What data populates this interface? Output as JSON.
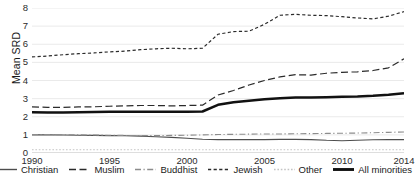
{
  "chart_data": {
    "type": "line",
    "title": "",
    "xlabel": "",
    "ylabel": "Mean SRD",
    "xlim": [
      1990,
      2014
    ],
    "ylim": [
      0,
      8
    ],
    "yticks": [
      0,
      1,
      2,
      3,
      4,
      5,
      6,
      7,
      8
    ],
    "xticks": [
      1990,
      1995,
      2000,
      2005,
      2010,
      2014
    ],
    "grid": "horizontal",
    "legend_position": "bottom",
    "x": [
      1990,
      1991,
      1992,
      1993,
      1994,
      1995,
      1996,
      1997,
      1998,
      1999,
      2000,
      2001,
      2002,
      2003,
      2004,
      2005,
      2006,
      2007,
      2008,
      2009,
      2010,
      2011,
      2012,
      2013,
      2014
    ],
    "series": [
      {
        "name": "Christian",
        "style": "solid-thin",
        "color": "#4d4d4d",
        "values": [
          1.0,
          1.0,
          0.99,
          0.98,
          0.97,
          0.96,
          0.95,
          0.93,
          0.9,
          0.86,
          0.81,
          0.76,
          0.74,
          0.74,
          0.74,
          0.74,
          0.75,
          0.75,
          0.74,
          0.7,
          0.68,
          0.7,
          0.73,
          0.74,
          0.74
        ]
      },
      {
        "name": "Muslim",
        "style": "long-dash",
        "color": "#2b2b2b",
        "values": [
          2.55,
          2.52,
          2.52,
          2.54,
          2.55,
          2.58,
          2.6,
          2.62,
          2.62,
          2.6,
          2.62,
          2.64,
          3.2,
          3.45,
          3.75,
          4.0,
          4.2,
          4.32,
          4.3,
          4.4,
          4.45,
          4.48,
          4.55,
          4.7,
          5.2
        ]
      },
      {
        "name": "Buddhist",
        "style": "dash-dot",
        "color": "#8c8c8c",
        "values": [
          1.02,
          1.02,
          1.01,
          1.0,
          0.99,
          0.98,
          0.97,
          0.96,
          0.96,
          0.97,
          0.98,
          1.0,
          1.02,
          1.03,
          1.04,
          1.05,
          1.05,
          1.06,
          1.07,
          1.08,
          1.09,
          1.1,
          1.12,
          1.14,
          1.16
        ]
      },
      {
        "name": "Jewish",
        "style": "short-dash",
        "color": "#2b2b2b",
        "values": [
          5.3,
          5.35,
          5.42,
          5.48,
          5.52,
          5.58,
          5.62,
          5.7,
          5.75,
          5.78,
          5.75,
          5.78,
          6.55,
          6.7,
          6.72,
          7.1,
          7.6,
          7.65,
          7.6,
          7.58,
          7.52,
          7.45,
          7.4,
          7.55,
          7.8
        ]
      },
      {
        "name": "Other",
        "style": "fine-dot",
        "color": "#c4c4c4",
        "values": [
          0.18,
          0.18,
          0.18,
          0.18,
          0.18,
          0.18,
          0.18,
          0.18,
          0.18,
          0.18,
          0.18,
          0.18,
          0.18,
          0.18,
          0.18,
          0.18,
          0.18,
          0.18,
          0.18,
          0.18,
          0.18,
          0.18,
          0.18,
          0.18,
          0.18
        ]
      },
      {
        "name": "All minorities",
        "style": "solid-bold",
        "color": "#111111",
        "values": [
          2.25,
          2.24,
          2.24,
          2.25,
          2.26,
          2.27,
          2.28,
          2.28,
          2.28,
          2.27,
          2.28,
          2.29,
          2.66,
          2.8,
          2.88,
          2.96,
          3.02,
          3.06,
          3.06,
          3.08,
          3.1,
          3.12,
          3.16,
          3.22,
          3.3
        ]
      }
    ]
  },
  "legend": {
    "items": [
      {
        "label": "Christian"
      },
      {
        "label": "Muslim"
      },
      {
        "label": "Buddhist"
      },
      {
        "label": "Jewish"
      },
      {
        "label": "Other"
      },
      {
        "label": "All minorities"
      }
    ]
  }
}
